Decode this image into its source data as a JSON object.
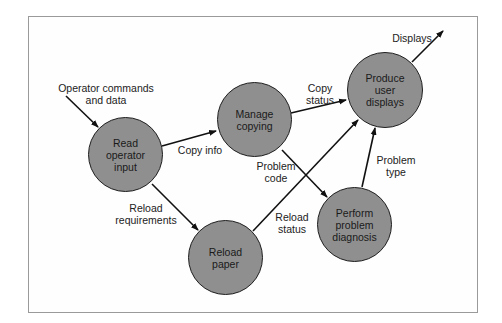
{
  "diagram": {
    "type": "data-flow",
    "nodes": [
      {
        "id": "read",
        "label": "Read\noperator\ninput"
      },
      {
        "id": "manage",
        "label": "Manage\ncopying"
      },
      {
        "id": "produce",
        "label": "Produce\nuser\ndisplays"
      },
      {
        "id": "reload",
        "label": "Reload\npaper"
      },
      {
        "id": "diagnose",
        "label": "Perform\nproblem\ndiagnosis"
      }
    ],
    "edges": [
      {
        "from": "external",
        "to": "read",
        "label": "Operator commands\nand data"
      },
      {
        "from": "read",
        "to": "manage",
        "label": "Copy info"
      },
      {
        "from": "read",
        "to": "reload",
        "label": "Reload\nrequirements"
      },
      {
        "from": "manage",
        "to": "produce",
        "label": "Copy\nstatus"
      },
      {
        "from": "manage",
        "to": "diagnose",
        "label": "Problem\ncode"
      },
      {
        "from": "reload",
        "to": "produce",
        "label": "Reload\nstatus"
      },
      {
        "from": "diagnose",
        "to": "produce",
        "label": "Problem\ntype"
      },
      {
        "from": "produce",
        "to": "external",
        "label": "Displays"
      }
    ]
  }
}
